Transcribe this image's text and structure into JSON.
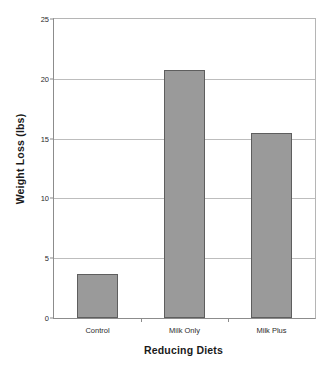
{
  "chart_data": {
    "type": "bar",
    "title": "",
    "xlabel": "Reducing Diets",
    "ylabel": "Weight Loss (lbs)",
    "categories": [
      "Control",
      "Milk Only",
      "Milk Plus"
    ],
    "values": [
      3.7,
      20.7,
      15.5
    ],
    "ylim": [
      0,
      25
    ],
    "yticks": [
      0,
      5,
      10,
      15,
      20,
      25
    ],
    "ytick_labels": [
      "0",
      "5",
      "10",
      "15",
      "20",
      "25"
    ],
    "grid": true,
    "legend": "none",
    "series": [
      {
        "name": "Weight Loss",
        "values": [
          3.7,
          20.7,
          15.5
        ]
      }
    ],
    "colors": {
      "bar_fill": "#9a9a9a",
      "bar_edge": "#5e5e5e",
      "gridline": "#bdbdbd",
      "axis": "#8c8c8c",
      "text": "#1a1a1a",
      "background": "#ffffff"
    }
  }
}
